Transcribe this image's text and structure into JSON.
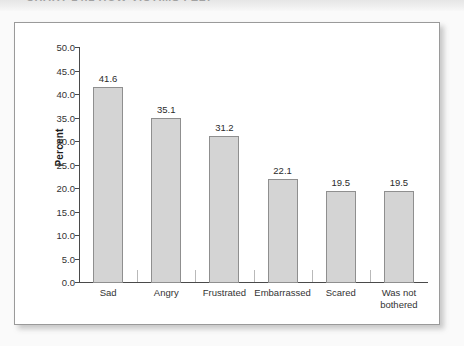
{
  "page": {
    "header_strip_ghost_text": "CHART 14.1   HOW VICTIMS FELT",
    "panel_background": "#ffffff",
    "page_background": "#fafafa"
  },
  "chart_data": {
    "type": "bar",
    "title": "",
    "xlabel": "",
    "ylabel": "Percent",
    "categories": [
      "Sad",
      "Angry",
      "Frustrated",
      "Embarrassed",
      "Scared",
      "Was not\nbothered"
    ],
    "values": [
      41.6,
      35.1,
      31.2,
      22.1,
      19.5,
      19.5
    ],
    "value_labels": [
      "41.6",
      "35.1",
      "31.2",
      "22.1",
      "19.5",
      "19.5"
    ],
    "ylim": [
      0.0,
      50.0
    ],
    "ytick_step": 5.0,
    "ytick_labels": [
      "50.0",
      "45.0",
      "40.0",
      "35.0",
      "30.0",
      "25.0",
      "20.0",
      "15.0",
      "10.0",
      "5.0",
      "0.0"
    ],
    "ytick_values": [
      50.0,
      45.0,
      40.0,
      35.0,
      30.0,
      25.0,
      20.0,
      15.0,
      10.0,
      5.0,
      0.0
    ],
    "grid": false,
    "legend": false,
    "bar_color": "#d4d4d4",
    "bar_border_color": "#8f8f8f",
    "axis_color": "#4a4a4a"
  }
}
